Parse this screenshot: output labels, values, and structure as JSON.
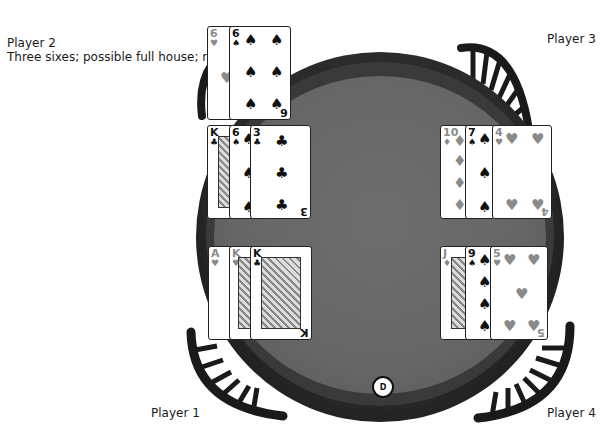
{
  "players": [
    {
      "id": "player1",
      "name": "Player 1",
      "note": ""
    },
    {
      "id": "player2",
      "name": "Player 2",
      "note": "Three sixes; possible full house; raises."
    },
    {
      "id": "player3",
      "name": "Player 3",
      "note": ""
    },
    {
      "id": "player4",
      "name": "Player 4",
      "note": ""
    }
  ],
  "dealer_button": {
    "label": "D"
  },
  "hands": {
    "player2_top": [
      {
        "rank": "6",
        "suit": "♥",
        "color": "red"
      },
      {
        "rank": "6",
        "suit": "♠",
        "color": "blk"
      }
    ],
    "player2_mid": [
      {
        "rank": "K",
        "suit": "♣",
        "color": "blk"
      },
      {
        "rank": "6",
        "suit": "♠",
        "color": "blk"
      },
      {
        "rank": "3",
        "suit": "♣",
        "color": "blk"
      }
    ],
    "player1": [
      {
        "rank": "A",
        "suit": "♥",
        "color": "red"
      },
      {
        "rank": "K",
        "suit": "♥",
        "color": "red"
      },
      {
        "rank": "K",
        "suit": "♣",
        "color": "blk"
      }
    ],
    "player3": [
      {
        "rank": "10",
        "suit": "♦",
        "color": "red"
      },
      {
        "rank": "7",
        "suit": "♠",
        "color": "blk"
      },
      {
        "rank": "4",
        "suit": "♥",
        "color": "red"
      }
    ],
    "player4": [
      {
        "rank": "J",
        "suit": "♦",
        "color": "red"
      },
      {
        "rank": "9",
        "suit": "♠",
        "color": "blk"
      },
      {
        "rank": "5",
        "suit": "♥",
        "color": "red"
      }
    ]
  },
  "colors": {
    "felt": "#666666",
    "rim": "#222222",
    "red_suit": "#8a8a8a",
    "black_suit": "#111111"
  }
}
